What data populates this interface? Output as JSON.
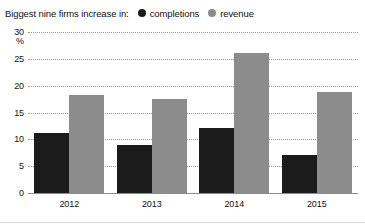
{
  "legend": {
    "title": "Biggest nine firms increase in:",
    "entries": [
      {
        "label": "completions",
        "color": "#1b1b1b",
        "marker": "circle"
      },
      {
        "label": "revenue",
        "color": "#8c8c8c",
        "marker": "circle"
      }
    ]
  },
  "axis": {
    "unit_label": "%",
    "y_ticks": [
      "0",
      "5",
      "10",
      "15",
      "20",
      "25",
      "30"
    ],
    "x_ticks": [
      "2012",
      "2013",
      "2014",
      "2015"
    ]
  },
  "chart_data": {
    "type": "bar",
    "title": "Biggest nine firms increase in:",
    "xlabel": "",
    "ylabel": "%",
    "ylim": [
      0,
      30
    ],
    "ytick_step": 5,
    "grid": true,
    "legend_position": "top",
    "categories": [
      "2012",
      "2013",
      "2014",
      "2015"
    ],
    "series": [
      {
        "name": "completions",
        "color": "#1b1b1b",
        "values": [
          11.2,
          9.0,
          12.2,
          7.1
        ]
      },
      {
        "name": "revenue",
        "color": "#8c8c8c",
        "values": [
          18.2,
          17.5,
          26.0,
          18.8
        ]
      }
    ]
  }
}
